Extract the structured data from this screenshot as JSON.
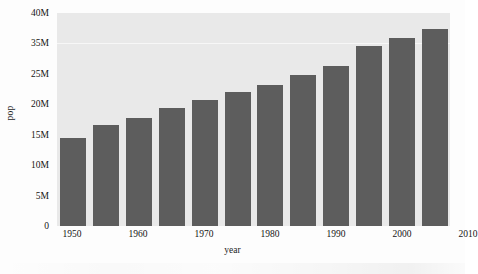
{
  "chart_data": {
    "type": "bar",
    "title": "",
    "xlabel": "year",
    "ylabel": "pop",
    "categories": [
      1950,
      1955,
      1960,
      1965,
      1970,
      1975,
      1980,
      1985,
      1990,
      1995,
      2000,
      2005
    ],
    "values": [
      14800000,
      16800000,
      18800000,
      20600000,
      22000000,
      23700000,
      25200000,
      26600000,
      28600000,
      35500000,
      37000000,
      38500000
    ],
    "value_labels": [
      "14.8M",
      "16.8M",
      "18.8M",
      "20.6M",
      "22.0M",
      "23.7M",
      "25.2M",
      "26.6M",
      "28.6M",
      "35.5M",
      "37.0M",
      "38.5M"
    ],
    "bar_color": "#5d5d5d",
    "plot_background": "#e9e9e9",
    "grid": true,
    "grid_lines": [
      "35M"
    ],
    "legend": null,
    "legend_position": "none",
    "xlim": [
      1947.5,
      2010
    ],
    "ylim": [
      0,
      40
    ],
    "x_axis": {
      "label": "year",
      "ticks": [
        {
          "label": "1950",
          "pos_pct": 3.8
        },
        {
          "label": "1960",
          "pos_pct": 20.6
        },
        {
          "label": "1970",
          "pos_pct": 37.4
        },
        {
          "label": "1980",
          "pos_pct": 54.2
        },
        {
          "label": "1990",
          "pos_pct": 71.0
        },
        {
          "label": "2000",
          "pos_pct": 87.8
        },
        {
          "label": "2010",
          "pos_pct": 104.6
        }
      ]
    },
    "y_axis": {
      "label": "pop",
      "ticks": [
        {
          "label": "40M",
          "pos_pct": 0.0
        },
        {
          "label": "35M",
          "pos_pct": 14.28
        },
        {
          "label": "25M",
          "pos_pct": 28.57
        },
        {
          "label": "20M",
          "pos_pct": 42.85
        },
        {
          "label": "15M",
          "pos_pct": 57.14
        },
        {
          "label": "10M",
          "pos_pct": 71.42
        },
        {
          "label": "5M",
          "pos_pct": 85.71
        },
        {
          "label": "0",
          "pos_pct": 100.0
        }
      ]
    },
    "bars": [
      {
        "year": "1950",
        "label": "14.8M",
        "top_pct": 58.7
      },
      {
        "year": "1955",
        "label": "16.8M",
        "top_pct": 52.6
      },
      {
        "year": "1960",
        "label": "18.8M",
        "top_pct": 49.3
      },
      {
        "year": "1965",
        "label": "20.6M",
        "top_pct": 44.6
      },
      {
        "year": "1970",
        "label": "22.0M",
        "top_pct": 40.8
      },
      {
        "year": "1975",
        "label": "23.7M",
        "top_pct": 37.1
      },
      {
        "year": "1980",
        "label": "25.2M",
        "top_pct": 33.8
      },
      {
        "year": "1985",
        "label": "26.6M",
        "top_pct": 29.1
      },
      {
        "year": "1990",
        "label": "28.6M",
        "top_pct": 24.9
      },
      {
        "year": "1995",
        "label": "35.5M",
        "top_pct": 15.5
      },
      {
        "year": "2000",
        "label": "37.0M",
        "top_pct": 11.7
      },
      {
        "year": "2005",
        "label": "38.5M",
        "top_pct": 7.5
      }
    ]
  }
}
